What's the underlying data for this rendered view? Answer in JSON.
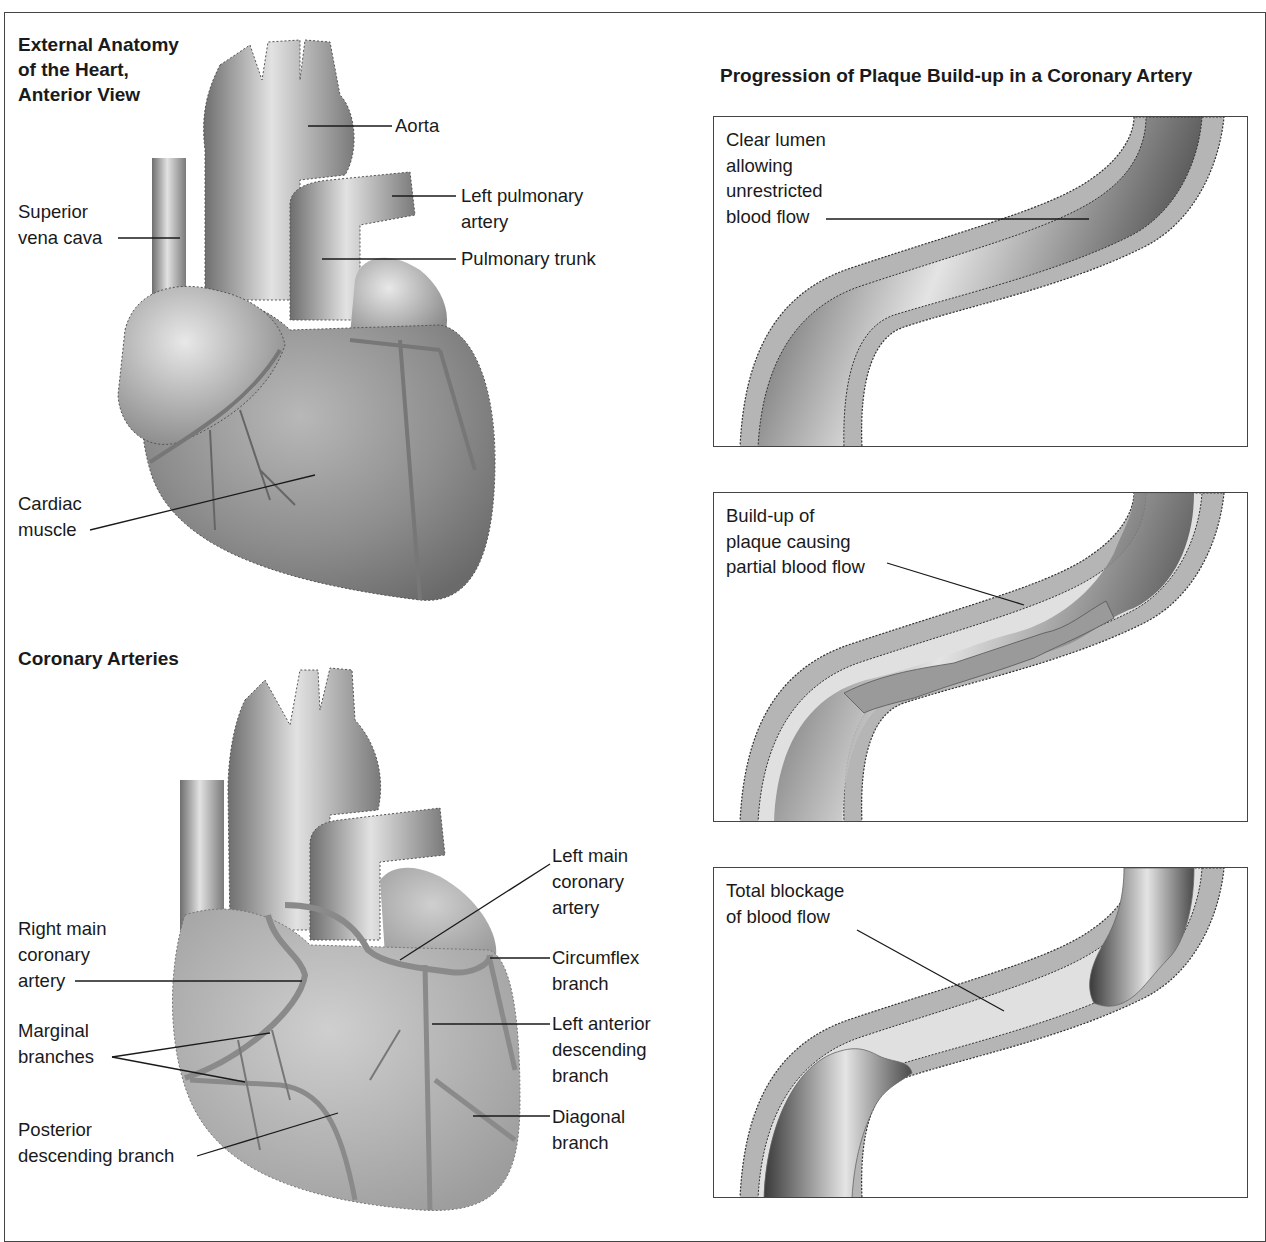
{
  "figure": {
    "left_column": {
      "external_anatomy": {
        "title_lines": [
          "External Anatomy",
          "of the Heart,",
          "Anterior View"
        ],
        "labels": {
          "aorta": "Aorta",
          "left_pulmonary_artery": [
            "Left pulmonary",
            "artery"
          ],
          "superior_vena_cava": [
            "Superior",
            "vena cava"
          ],
          "pulmonary_trunk": "Pulmonary trunk",
          "cardiac_muscle": [
            "Cardiac",
            "muscle"
          ]
        }
      },
      "coronary_arteries": {
        "title": "Coronary Arteries",
        "labels": {
          "left_main_coronary_artery": [
            "Left main",
            "coronary",
            "artery"
          ],
          "right_main_coronary_artery": [
            "Right main",
            "coronary",
            "artery"
          ],
          "circumflex_branch": [
            "Circumflex",
            "branch"
          ],
          "marginal_branches": [
            "Marginal",
            "branches"
          ],
          "left_anterior_descending_branch": [
            "Left anterior",
            "descending",
            "branch"
          ],
          "diagonal_branch": [
            "Diagonal",
            "branch"
          ],
          "posterior_descending_branch": [
            "Posterior",
            "descending branch"
          ]
        }
      }
    },
    "right_column": {
      "title": "Progression of Plaque Build-up in a Coronary Artery",
      "panels": [
        {
          "stage": "clear",
          "label_lines": [
            "Clear lumen",
            "allowing",
            "unrestricted",
            "blood flow"
          ]
        },
        {
          "stage": "partial",
          "label_lines": [
            "Build-up of",
            "plaque causing",
            "partial blood flow"
          ]
        },
        {
          "stage": "total",
          "label_lines": [
            "Total blockage",
            "of blood flow"
          ]
        }
      ]
    },
    "colors": {
      "ink": "#1a1a1a",
      "border": "#444444",
      "artery_wall": "#b5b5b5",
      "lumen_dark": "#3a3a3a",
      "lumen_light": "#e6e6e6",
      "plaque": "#d9d9d9"
    }
  }
}
